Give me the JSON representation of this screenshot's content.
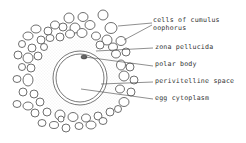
{
  "diagram": {
    "colors": {
      "stroke": "#4a4a4a",
      "zona": "#d9d9d9",
      "background": "#ffffff"
    },
    "egg": {
      "cx": 80,
      "cy": 78,
      "outer_r": 27,
      "inner_r": 24,
      "zona_r": 45
    },
    "polar_body": {
      "cx": 84,
      "cy": 57,
      "rx": 3,
      "ry": 2
    },
    "labels": [
      {
        "id": "cells-of-cumulus-oophorus",
        "lines": [
          "cells of cumulus",
          "oophorus"
        ],
        "x": 153,
        "y": 22
      },
      {
        "id": "zona-pellucida",
        "lines": [
          "zona pellucida"
        ],
        "x": 155,
        "y": 49
      },
      {
        "id": "polar-body",
        "lines": [
          "polar body"
        ],
        "x": 155,
        "y": 66
      },
      {
        "id": "perivitelline-space",
        "lines": [
          "perivitelline space"
        ],
        "x": 155,
        "y": 83
      },
      {
        "id": "egg-cytoplasm",
        "lines": [
          "egg cytoplasm"
        ],
        "x": 155,
        "y": 100
      }
    ],
    "leaders": [
      {
        "for": "cells-of-cumulus-oophorus",
        "x1": 118,
        "y1": 26,
        "x2": 152,
        "y2": 23
      },
      {
        "for": "cells-of-cumulus-oophorus",
        "x1": 124,
        "y1": 40,
        "x2": 152,
        "y2": 25
      },
      {
        "for": "zona-pellucida",
        "x1": 96,
        "y1": 51,
        "x2": 153,
        "y2": 48
      },
      {
        "for": "polar-body",
        "x1": 85,
        "y1": 57,
        "x2": 153,
        "y2": 66
      },
      {
        "for": "perivitelline-space",
        "x1": 101,
        "y1": 84,
        "x2": 153,
        "y2": 82
      },
      {
        "for": "egg-cytoplasm",
        "x1": 81,
        "y1": 89,
        "x2": 153,
        "y2": 99
      }
    ],
    "cells": [
      [
        69,
        18,
        5,
        5
      ],
      [
        83,
        17,
        5,
        4.5
      ],
      [
        103,
        15,
        5,
        5
      ],
      [
        55,
        25,
        4.5,
        4
      ],
      [
        63,
        27,
        4,
        4
      ],
      [
        75,
        28,
        5,
        5
      ],
      [
        90,
        25,
        5,
        4.5
      ],
      [
        111,
        28,
        6,
        5.5
      ],
      [
        36,
        29,
        5,
        4
      ],
      [
        48,
        31,
        4,
        4
      ],
      [
        28,
        36,
        5,
        4
      ],
      [
        41,
        40,
        4,
        4
      ],
      [
        50,
        38,
        4,
        3.5
      ],
      [
        60,
        37,
        4,
        4
      ],
      [
        70,
        34,
        4.5,
        4
      ],
      [
        82,
        33,
        5,
        4.5
      ],
      [
        96,
        36,
        4.5,
        4
      ],
      [
        107,
        40,
        5,
        5
      ],
      [
        121,
        41,
        5,
        4.5
      ],
      [
        22,
        44,
        3.5,
        3.5
      ],
      [
        32,
        48,
        4,
        4
      ],
      [
        44,
        47,
        3.5,
        3.5
      ],
      [
        100,
        45,
        4,
        4
      ],
      [
        113,
        47,
        4.5,
        4
      ],
      [
        18,
        55,
        4,
        4
      ],
      [
        28,
        58,
        5,
        5
      ],
      [
        38,
        56,
        4,
        4
      ],
      [
        116,
        54,
        4.5,
        4
      ],
      [
        126,
        52,
        4,
        4
      ],
      [
        22,
        67,
        3.5,
        3.5
      ],
      [
        31,
        68,
        4,
        4
      ],
      [
        121,
        65,
        4.5,
        5
      ],
      [
        130,
        67,
        4,
        4
      ],
      [
        17,
        79,
        4,
        3.5
      ],
      [
        28,
        80,
        5,
        6
      ],
      [
        124,
        76,
        5,
        5
      ],
      [
        134,
        80,
        4,
        4
      ],
      [
        23,
        92,
        4,
        4
      ],
      [
        34,
        94,
        4,
        4
      ],
      [
        120,
        89,
        4.5,
        4
      ],
      [
        131,
        92,
        4,
        4
      ],
      [
        17,
        104,
        4,
        3.5
      ],
      [
        28,
        106,
        5,
        4
      ],
      [
        40,
        102,
        4,
        4
      ],
      [
        124,
        102,
        5,
        4.5
      ],
      [
        35,
        113,
        4,
        4
      ],
      [
        47,
        112,
        4,
        4
      ],
      [
        60,
        115,
        5,
        5
      ],
      [
        73,
        117,
        5,
        4.5
      ],
      [
        86,
        118,
        4.5,
        4
      ],
      [
        98,
        116,
        4,
        4
      ],
      [
        110,
        112,
        4,
        4
      ],
      [
        118,
        109,
        3.5,
        3.5
      ],
      [
        42,
        123,
        4,
        3.5
      ],
      [
        54,
        125,
        4.5,
        3.5
      ],
      [
        66,
        128,
        4,
        4
      ],
      [
        79,
        126,
        4,
        3.5
      ],
      [
        91,
        125,
        5,
        4
      ],
      [
        103,
        121,
        4,
        3.5
      ],
      [
        61,
        119,
        3,
        3
      ]
    ]
  }
}
